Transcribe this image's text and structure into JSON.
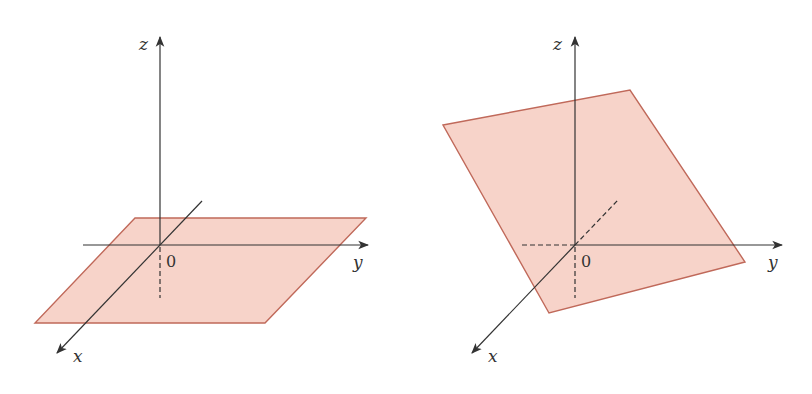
{
  "figures": [
    {
      "id": "horizontal-plane",
      "description": "Plane parallel to the xy-plane",
      "plane": {
        "points": [
          [
            135,
            218
          ],
          [
            366,
            218
          ],
          [
            265,
            323
          ],
          [
            35,
            323
          ]
        ],
        "fill": "#f7d3c9",
        "stroke": "#c0695a"
      },
      "origin": [
        160,
        245
      ],
      "axes": {
        "z": {
          "label": "z",
          "tip": [
            160,
            37
          ],
          "start": [
            160,
            245
          ],
          "dashed_below_to": [
            160,
            298
          ],
          "label_pos": [
            143,
            48
          ]
        },
        "y": {
          "label": "y",
          "tip": [
            368,
            245
          ],
          "start": [
            83,
            245
          ],
          "label_pos": [
            353,
            266
          ]
        },
        "x": {
          "label": "x",
          "tip": [
            57,
            353
          ],
          "start": [
            202,
            201
          ],
          "label_pos": [
            75,
            360
          ]
        }
      },
      "origin_label": {
        "text": "0",
        "pos": [
          167,
          265
        ]
      }
    },
    {
      "id": "tilted-plane",
      "description": "Inclined plane through the y-axis",
      "plane": {
        "points": [
          [
            443,
            125
          ],
          [
            630,
            90
          ],
          [
            745,
            262
          ],
          [
            549,
            313
          ]
        ],
        "fill": "#f7d3c9",
        "stroke": "#c0695a"
      },
      "origin": [
        575,
        245
      ],
      "axes": {
        "z": {
          "label": "z",
          "tip": [
            575,
            37
          ],
          "start": [
            575,
            245
          ],
          "dashed_below_to": [
            575,
            298
          ],
          "label_pos": [
            555,
            48
          ]
        },
        "y": {
          "label": "y",
          "tip": [
            782,
            245
          ],
          "start": [
            575,
            245
          ],
          "dashed_from": [
            522,
            245
          ],
          "label_pos": [
            768,
            266
          ]
        },
        "x": {
          "label": "x",
          "tip": [
            472,
            353
          ],
          "start": [
            575,
            245
          ],
          "dashed_to": [
            618,
            200
          ],
          "label_pos": [
            490,
            360
          ]
        }
      },
      "origin_label": {
        "text": "0",
        "pos": [
          582,
          265
        ]
      }
    }
  ],
  "colors": {
    "axis": "#333333",
    "plane_fill": "#f7d3c9",
    "plane_stroke": "#c0695a",
    "background": "#ffffff"
  }
}
